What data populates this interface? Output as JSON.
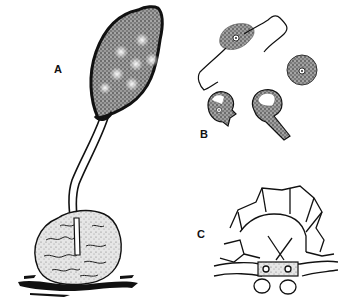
{
  "figure": {
    "labels": {
      "a": "A",
      "b": "B",
      "c": "C"
    },
    "parts": [
      {
        "id": "A",
        "description": "sporangium on long stalk emerging from host cell"
      },
      {
        "id": "B",
        "description": "flagellated zoospore, encysted spore and germinating spores"
      },
      {
        "id": "C",
        "description": "cross-section of host tissue with resting structures"
      }
    ],
    "colors": {
      "ink": "#111111",
      "stipple": "#7a7a7a",
      "background": "#ffffff"
    }
  }
}
